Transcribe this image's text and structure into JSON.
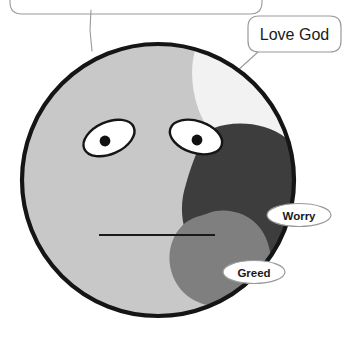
{
  "image": {
    "kind": "illustration",
    "subject": "cartoon face divided into shaded regions with callout labels",
    "width": 344,
    "height": 340,
    "background_color": "#ffffff"
  },
  "face": {
    "name": "round-face",
    "fill_color": "#c8c8c8",
    "outline_color": "#151515",
    "outline_width": 4,
    "center_x": 158,
    "center_y": 180,
    "radius_x": 137,
    "radius_y": 137
  },
  "regions": [
    {
      "id": "love-god",
      "label": "Love God",
      "fill_color": "#f2f2f2",
      "position": "upper-right"
    },
    {
      "id": "worry",
      "label": "Worry",
      "fill_color": "#3d3d3d",
      "position": "middle-right"
    },
    {
      "id": "greed",
      "label": "Greed",
      "fill_color": "#7f7f7f",
      "position": "lower-right"
    }
  ],
  "features": {
    "left_eye": {
      "name": "left-eye",
      "sclera_color": "#ffffff",
      "outline_color": "#151515",
      "pupil_color": "#111111"
    },
    "right_eye": {
      "name": "right-eye",
      "sclera_color": "#ffffff",
      "outline_color": "#151515",
      "pupil_color": "#111111"
    },
    "mouth": {
      "name": "mouth-line",
      "color": "#1a1a1a",
      "style": "straight-horizontal-line"
    }
  },
  "callouts": [
    {
      "id": "love-god-callout",
      "text": "Love God",
      "shape": "rounded-rectangle",
      "fill": "#ffffff",
      "border": "#9a9a9a",
      "text_color": "#1a1a1a"
    },
    {
      "id": "worry-callout",
      "text": "Worry",
      "shape": "pill",
      "fill": "#ffffff",
      "border": "#9a9a9a",
      "text_color": "#1a1a1a"
    },
    {
      "id": "greed-callout",
      "text": "Greed",
      "shape": "pill",
      "fill": "#ffffff",
      "border": "#9a9a9a",
      "text_color": "#1a1a1a"
    },
    {
      "id": "top-cropped-callout",
      "text": "",
      "shape": "rounded-rectangle-cropped",
      "fill": "#ffffff",
      "border": "#9a9a9a",
      "text_color": "#1a1a1a"
    }
  ],
  "leader_lines": {
    "color": "#9a9a9a",
    "width": 1
  }
}
